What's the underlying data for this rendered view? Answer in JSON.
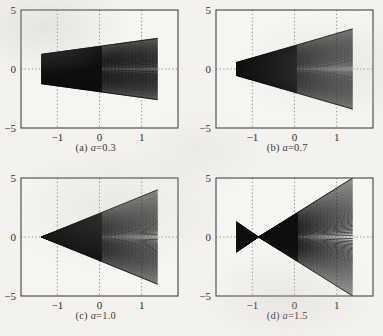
{
  "figure": {
    "type": "multi-panel-line-family",
    "panel_count": 4,
    "background_color": "#f3f2ef",
    "ink_color": "#111111",
    "frame_color": "#4a4a48",
    "grid_color": "#8a8a88"
  },
  "panels": [
    {
      "id": "a",
      "caption_prefix": "(a)",
      "caption_param": "a",
      "caption_eq": "=",
      "caption_value": "0.3",
      "caption_full": "(a) a = 0.3",
      "chart_data": {
        "type": "line",
        "title": "(a) a = 0.3",
        "xlabel": "",
        "ylabel": "",
        "xlim": [
          -1.35,
          1.35
        ],
        "ylim": [
          -5,
          5
        ],
        "xticks": [
          -1,
          0,
          1
        ],
        "xticklabels": [
          "−1",
          "0",
          "1"
        ],
        "yticks": [
          -5,
          0,
          5
        ],
        "yticklabels": [
          "−5",
          "0",
          "5"
        ],
        "grid": true,
        "grid_style": "dotted",
        "parameter": {
          "name": "a",
          "value": 0.3
        },
        "envelope": {
          "x_start": -1.0,
          "x_end": 1.0,
          "y_at_start": 1.25,
          "y_at_end": 2.6,
          "shape": "wedge-widening-right",
          "symmetric_about_y0": true
        },
        "curve_count": 60,
        "series_note": "family of curves filling wedge from (−1, ±1.25) to (+1, ±2.6)"
      }
    },
    {
      "id": "b",
      "caption_prefix": "(b)",
      "caption_param": "a",
      "caption_eq": "=",
      "caption_value": "0.7",
      "caption_full": "(b) a = 0.7",
      "chart_data": {
        "type": "line",
        "title": "(b) a = 0.7",
        "xlabel": "",
        "ylabel": "",
        "xlim": [
          -1.35,
          1.35
        ],
        "ylim": [
          -5,
          5
        ],
        "xticks": [
          -1,
          0,
          1
        ],
        "xticklabels": [
          "−1",
          "0",
          "1"
        ],
        "yticks": [
          -5,
          0,
          5
        ],
        "yticklabels": [
          "−5",
          "0",
          "5"
        ],
        "grid": true,
        "grid_style": "dotted",
        "parameter": {
          "name": "a",
          "value": 0.7
        },
        "envelope": {
          "x_start": -1.0,
          "x_end": 1.0,
          "y_at_start": 0.55,
          "y_at_end": 3.4,
          "shape": "wedge-widening-right",
          "symmetric_about_y0": true
        },
        "curve_count": 60,
        "series_note": "family of curves filling wedge from (−1, ±0.55) to (+1, ±3.4)"
      }
    },
    {
      "id": "c",
      "caption_prefix": "(c)",
      "caption_param": "a",
      "caption_eq": "=",
      "caption_value": "1.0",
      "caption_full": "(c) a = 1.0",
      "chart_data": {
        "type": "line",
        "title": "(c) a = 1.0",
        "xlabel": "",
        "ylabel": "",
        "xlim": [
          -1.35,
          1.35
        ],
        "ylim": [
          -5,
          5
        ],
        "xticks": [
          -1,
          0,
          1
        ],
        "xticklabels": [
          "−1",
          "0",
          "1"
        ],
        "yticks": [
          -5,
          0,
          5
        ],
        "yticklabels": [
          "−5",
          "0",
          "5"
        ],
        "grid": true,
        "grid_style": "dotted",
        "parameter": {
          "name": "a",
          "value": 1.0
        },
        "envelope": {
          "x_start": -1.0,
          "x_end": 1.0,
          "y_at_start": 0.0,
          "y_at_end": 4.0,
          "shape": "triangle-apex-at-left",
          "symmetric_about_y0": true
        },
        "curve_count": 60,
        "series_note": "family of curves forming triangle with apex at (−1, 0) opening to (+1, ±4.0)"
      }
    },
    {
      "id": "d",
      "caption_prefix": "(d)",
      "caption_param": "a",
      "caption_eq": "=",
      "caption_value": "1.5",
      "caption_full": "(d) a = 1.5",
      "chart_data": {
        "type": "line",
        "title": "(d) a = 1.5",
        "xlabel": "",
        "ylabel": "",
        "xlim": [
          -1.35,
          1.35
        ],
        "ylim": [
          -5,
          5
        ],
        "xticks": [
          -1,
          0,
          1
        ],
        "xticklabels": [
          "−1",
          "0",
          "1"
        ],
        "yticks": [
          -5,
          0,
          5
        ],
        "yticklabels": [
          "−5",
          "0",
          "5"
        ],
        "grid": true,
        "grid_style": "dotted",
        "parameter": {
          "name": "a",
          "value": 1.5
        },
        "envelope": {
          "x_start": -1.0,
          "x_end": 1.0,
          "pinch_x": -0.62,
          "y_at_start": 1.3,
          "y_at_end": 5.0,
          "shape": "bowtie-left-lobe-then-widening-wedge",
          "symmetric_about_y0": true
        },
        "curve_count": 60,
        "series_note": "small triangular lobe from (−1, ±1.3) pinching to zero at x=−0.62, then wedge opening to (+1, ±5.0) clipped by frame"
      }
    }
  ]
}
